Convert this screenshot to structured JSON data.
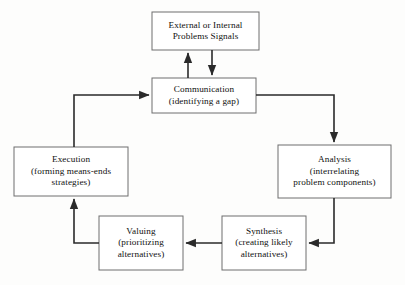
{
  "diagram": {
    "background_color": "#fdfdfc",
    "box_border_color": "#6e6e6e",
    "arrow_color": "#2a2a2a",
    "nodes": [
      {
        "id": "external-internal-problems-signals",
        "line1": "External or Internal",
        "line2": "Problems Signals",
        "line3": ""
      },
      {
        "id": "communication",
        "line1": "Communication",
        "line2": "(identifying a gap)",
        "line3": ""
      },
      {
        "id": "analysis",
        "line1": "Analysis",
        "line2": "(interrelating",
        "line3": "problem components)"
      },
      {
        "id": "synthesis",
        "line1": "Synthesis",
        "line2": "(creating likely",
        "line3": "alternatives)"
      },
      {
        "id": "valuing",
        "line1": "Valuing",
        "line2": "(prioritizing",
        "line3": "alternatives)"
      },
      {
        "id": "execution",
        "line1": "Execution",
        "line2": "(forming means-ends",
        "line3": "strategies)"
      }
    ],
    "connections": [
      {
        "id": "communication-to-signals",
        "from": "communication",
        "to": "external-internal-problems-signals",
        "direction": "up"
      },
      {
        "id": "signals-to-communication",
        "from": "external-internal-problems-signals",
        "to": "communication",
        "direction": "down"
      },
      {
        "id": "communication-to-analysis",
        "from": "communication",
        "to": "analysis",
        "direction": "right-down"
      },
      {
        "id": "analysis-to-synthesis",
        "from": "analysis",
        "to": "synthesis",
        "direction": "down-left"
      },
      {
        "id": "synthesis-to-valuing",
        "from": "synthesis",
        "to": "valuing",
        "direction": "left"
      },
      {
        "id": "valuing-to-execution",
        "from": "valuing",
        "to": "execution",
        "direction": "left-up"
      },
      {
        "id": "execution-to-communication",
        "from": "execution",
        "to": "communication",
        "direction": "up-right"
      }
    ]
  }
}
